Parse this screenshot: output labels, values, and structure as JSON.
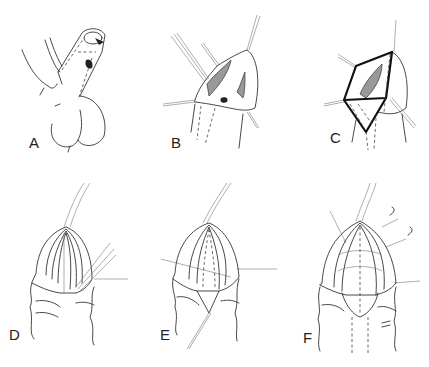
{
  "figure": {
    "panels": [
      {
        "id": "A",
        "label": "A",
        "caption": "Hypospadiac penis with glans, shaded meatus"
      },
      {
        "id": "B",
        "label": "B",
        "caption": "Stay sutures placed, glanular wings incised"
      },
      {
        "id": "C",
        "label": "C",
        "caption": "Geometric outline of incision (bold polygon)"
      },
      {
        "id": "D",
        "label": "D",
        "caption": "Catheter in place, glans wings opened, sutures"
      },
      {
        "id": "E",
        "label": "E",
        "caption": "Urethral plate tubularized over catheter"
      },
      {
        "id": "F",
        "label": "F",
        "caption": "Glans closed over neourethra with sutures"
      }
    ]
  },
  "colors": {
    "ink": "#333333",
    "shading": "#999999",
    "background": "#ffffff"
  }
}
